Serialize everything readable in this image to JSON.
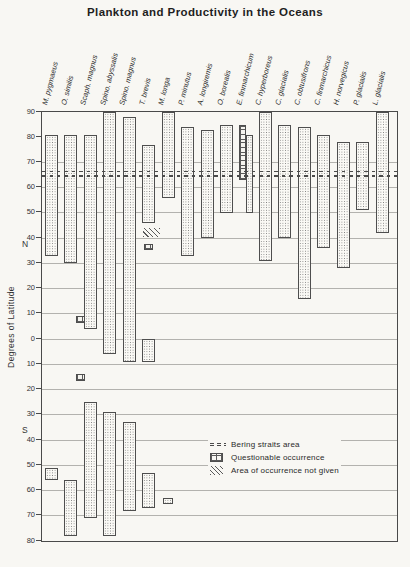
{
  "title": "Plankton and Productivity in the Oceans",
  "colors": {
    "paper": "#f8f7f3",
    "ink": "#4a4a4a",
    "grid": "#b3b2ae"
  },
  "chart_data": {
    "type": "bar",
    "subtype": "latitudinal-range-columns",
    "title": "Plankton and Productivity in the Oceans",
    "ylabel": "Degrees of Latitude",
    "hemisphere_labels": {
      "north": "N",
      "south": "S"
    },
    "y_axis": {
      "top": 90,
      "bottom": -80,
      "tick_step": 10,
      "ticks": [
        {
          "lat": 90,
          "label": "90"
        },
        {
          "lat": 80,
          "label": "80"
        },
        {
          "lat": 70,
          "label": "70"
        },
        {
          "lat": 60,
          "label": "60"
        },
        {
          "lat": 50,
          "label": "50"
        },
        {
          "lat": 40,
          "label": "40"
        },
        {
          "lat": 30,
          "label": "30"
        },
        {
          "lat": 20,
          "label": "20"
        },
        {
          "lat": 10,
          "label": "10"
        },
        {
          "lat": 0,
          "label": "0"
        },
        {
          "lat": -10,
          "label": "10"
        },
        {
          "lat": -20,
          "label": "20"
        },
        {
          "lat": -30,
          "label": "30"
        },
        {
          "lat": -40,
          "label": "40"
        },
        {
          "lat": -50,
          "label": "50"
        },
        {
          "lat": -60,
          "label": "60"
        },
        {
          "lat": -70,
          "label": "70"
        },
        {
          "lat": -80,
          "label": "80"
        }
      ],
      "gridline_lats": [
        70,
        60,
        50,
        40,
        30,
        20,
        10,
        0,
        -10,
        -20,
        -30,
        -40,
        -50,
        -60,
        -70
      ]
    },
    "bering_straits_lats": [
      66.6,
      64.9
    ],
    "legend": [
      {
        "symbol": "dashes",
        "label": "Bering straits area"
      },
      {
        "symbol": "crosshatch",
        "label": "Questionable occurrence"
      },
      {
        "symbol": "diagonal",
        "label": "Area of occurrence not given"
      }
    ],
    "species": [
      {
        "name": "M. pygmaeus",
        "bars": [
          {
            "from": 81,
            "to": 33,
            "style": "stipple"
          },
          {
            "from": -51,
            "to": -56,
            "style": "stipple"
          }
        ]
      },
      {
        "name": "O. similis",
        "bars": [
          {
            "from": 81,
            "to": 30,
            "style": "stipple"
          },
          {
            "from": -56,
            "to": -78,
            "style": "stipple"
          }
        ]
      },
      {
        "name": "Scaph. magnus",
        "bars": [
          {
            "from": 81,
            "to": 4,
            "style": "stipple"
          },
          {
            "from": 9,
            "to": 6.5,
            "style": "crosshatch",
            "w": 9,
            "dx": -10
          },
          {
            "from": -14,
            "to": -16.5,
            "style": "crosshatch",
            "w": 9,
            "dx": -10
          },
          {
            "from": -25,
            "to": -71,
            "style": "stipple"
          }
        ]
      },
      {
        "name": "Spino. abyssalis",
        "bars": [
          {
            "from": 90,
            "to": -6,
            "style": "stipple"
          },
          {
            "from": -29,
            "to": -78,
            "style": "stipple"
          }
        ]
      },
      {
        "name": "Spino. magnus",
        "bars": [
          {
            "from": 88,
            "to": -9,
            "style": "stipple"
          },
          {
            "from": -33,
            "to": -68,
            "style": "stipple"
          }
        ]
      },
      {
        "name": "T. brevis",
        "bars": [
          {
            "from": 77,
            "to": 46,
            "style": "stipple"
          },
          {
            "from": 44,
            "to": 40.5,
            "style": "diagonal",
            "w": 17,
            "dx": 3
          },
          {
            "from": 37.5,
            "to": 35.5,
            "style": "crosshatch",
            "w": 9
          },
          {
            "from": 0,
            "to": -9,
            "style": "stipple"
          },
          {
            "from": -53,
            "to": -67,
            "style": "stipple"
          }
        ]
      },
      {
        "name": "M. longa",
        "bars": [
          {
            "from": 90,
            "to": 56,
            "style": "stipple"
          },
          {
            "from": -63,
            "to": -65.5,
            "style": "stipple",
            "w": 10
          }
        ]
      },
      {
        "name": "P. minutus",
        "bars": [
          {
            "from": 84,
            "to": 33,
            "style": "stipple"
          }
        ]
      },
      {
        "name": "A. longiremis",
        "bars": [
          {
            "from": 83,
            "to": 40,
            "style": "stipple"
          }
        ]
      },
      {
        "name": "O. borealis",
        "bars": [
          {
            "from": 85,
            "to": 50,
            "style": "stipple"
          }
        ]
      },
      {
        "name": "E. finmarchicum",
        "bars": [
          {
            "from": 85,
            "to": 63,
            "style": "crosshatch",
            "w": 7,
            "dx": -3.5
          },
          {
            "from": 81,
            "to": 50,
            "style": "stipple",
            "w": 7,
            "dx": 3.5
          }
        ]
      },
      {
        "name": "C. hyperboreus",
        "bars": [
          {
            "from": 90,
            "to": 31,
            "style": "stipple"
          }
        ]
      },
      {
        "name": "C. glacialis",
        "bars": [
          {
            "from": 85,
            "to": 40,
            "style": "stipple"
          }
        ]
      },
      {
        "name": "C. obtusifrons",
        "bars": [
          {
            "from": 84,
            "to": 16,
            "style": "stipple"
          }
        ]
      },
      {
        "name": "C. finmarchicus",
        "bars": [
          {
            "from": 81,
            "to": 36,
            "style": "stipple"
          }
        ]
      },
      {
        "name": "H. norvegicus",
        "bars": [
          {
            "from": 78,
            "to": 28,
            "style": "stipple"
          }
        ]
      },
      {
        "name": "P. glacialis",
        "bars": [
          {
            "from": 78,
            "to": 51,
            "style": "stipple"
          }
        ]
      },
      {
        "name": "L. glacialis",
        "bars": [
          {
            "from": 90,
            "to": 42,
            "style": "stipple"
          }
        ]
      }
    ]
  }
}
